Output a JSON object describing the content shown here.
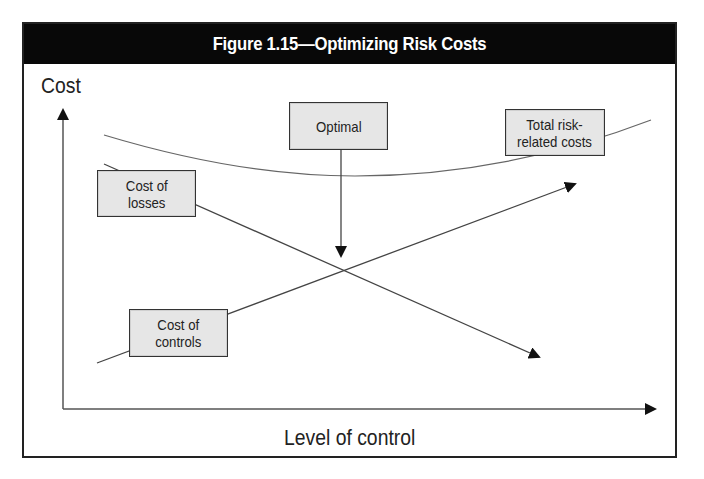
{
  "figure": {
    "title": "Figure 1.15—Optimizing Risk Costs",
    "y_axis_label": "Cost",
    "x_axis_label": "Level of control"
  },
  "callouts": {
    "optimal": "Optimal",
    "total_costs": "Total risk-\nrelated costs",
    "cost_of_losses": "Cost of\nlosses",
    "cost_of_controls": "Cost of\ncontrols"
  },
  "curves": [
    {
      "name": "Total risk-related costs",
      "shape": "U-shaped curve",
      "trend": "decreases then increases",
      "minimum_at": "optimal level of control"
    },
    {
      "name": "Cost of losses",
      "shape": "straight line",
      "trend": "decreasing as level of control increases"
    },
    {
      "name": "Cost of controls",
      "shape": "straight line",
      "trend": "increasing as level of control increases"
    }
  ],
  "annotation": {
    "optimal_point": "intersection of cost of losses and cost of controls"
  },
  "colors": {
    "title_bar_bg": "#080808",
    "title_text": "#ffffff",
    "callout_bg": "#e6e6e6",
    "line_color": "#444444"
  }
}
